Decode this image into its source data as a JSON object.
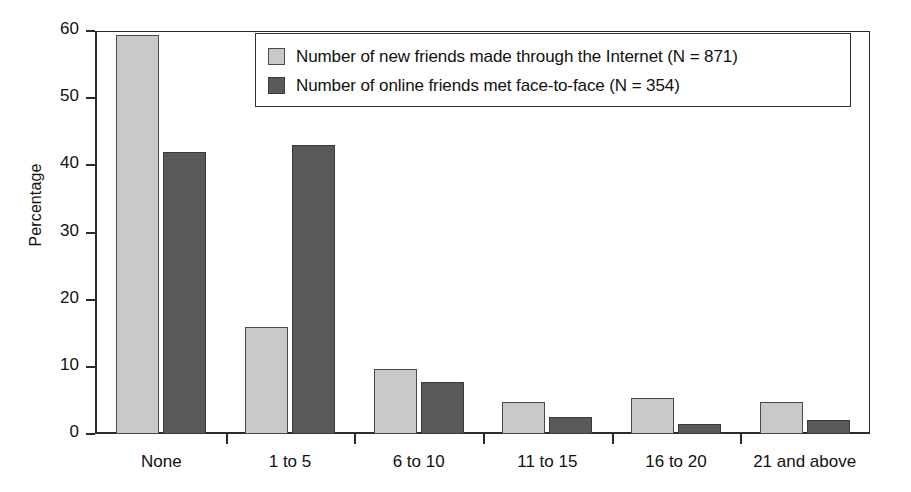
{
  "chart_data": {
    "type": "bar",
    "title": "",
    "subtitle": "",
    "xlabel": "",
    "ylabel": "Percentage",
    "ylim": [
      0,
      60
    ],
    "yticks": [
      0,
      10,
      20,
      30,
      40,
      50,
      60
    ],
    "ytick_labels": [
      "0",
      "10",
      "20",
      "30",
      "40",
      "50",
      "60"
    ],
    "grid": false,
    "legend_position": "top-right-inside",
    "categories": [
      "None",
      "1 to 5",
      "6 to 10",
      "11 to 15",
      "16 to 20",
      "21 and above"
    ],
    "series": [
      {
        "name": "Number of new friends made through the Internet (N = 871)",
        "color": "#c9c9c9",
        "values": [
          59.4,
          16.0,
          9.7,
          4.8,
          5.3,
          4.8
        ]
      },
      {
        "name": "Number of online friends met face-to-face (N = 354)",
        "color": "#595959",
        "values": [
          42.0,
          43.0,
          7.8,
          2.5,
          1.5,
          2.1
        ]
      }
    ]
  },
  "legend": {
    "entries": [
      {
        "label": "Number of new friends made through the Internet (N = 871)"
      },
      {
        "label": "Number of online friends met face-to-face (N = 354)"
      }
    ]
  },
  "axes": {
    "y_title": "Percentage"
  }
}
